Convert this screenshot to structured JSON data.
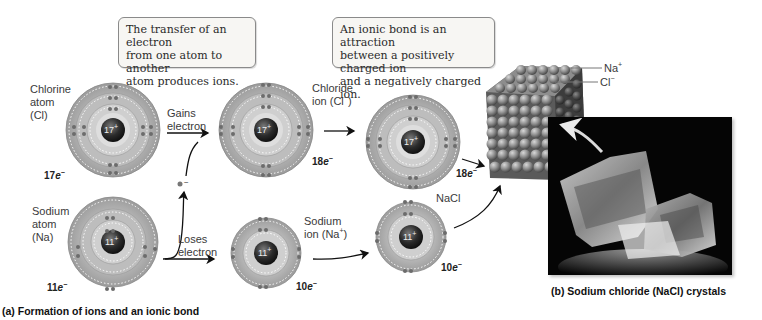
{
  "figure": {
    "part_a": {
      "caption": "(a) Formation of ions and an ionic bond",
      "callout_transfer": "The transfer of an electron from one atom to another atom produces ions.",
      "callout_transfer_lines": [
        "The transfer of an electron",
        "from one atom to another",
        "atom produces ions."
      ],
      "callout_bond_lines": [
        "An ionic bond is an attraction",
        "between a positively charged ion",
        "and a negatively charged ion."
      ],
      "chlorine_atom": {
        "label_lines": [
          "Chlorine",
          "atom",
          "(Cl)"
        ],
        "nucleus": "17",
        "nucleus_charge": "+",
        "electrons_num": "17",
        "electrons_unit": "e",
        "electrons_sup": "−"
      },
      "sodium_atom": {
        "label_lines": [
          "Sodium",
          "atom",
          "(Na)"
        ],
        "nucleus": "11",
        "nucleus_charge": "+",
        "electrons_num": "11",
        "electrons_unit": "e",
        "electrons_sup": "−"
      },
      "gains_electron": [
        "Gains",
        "electron"
      ],
      "loses_electron": [
        "Loses",
        "electron"
      ],
      "chloride_ion": {
        "label_line1": "Chloride",
        "label_line2_prefix": "ion (Cl",
        "label_sup": "−",
        "label_suffix": ")",
        "nucleus": "17",
        "nucleus_charge": "+",
        "electrons_num": "18",
        "electrons_unit": "e",
        "electrons_sup": "−"
      },
      "sodium_ion": {
        "label_line1": "Sodium",
        "label_line2_prefix": "ion (Na",
        "label_sup": "+",
        "label_suffix": ")",
        "nucleus": "11",
        "nucleus_charge": "+",
        "electrons_num": "10",
        "electrons_unit": "e",
        "electrons_sup": "−"
      },
      "nacl": {
        "label": "NaCl",
        "chloride": {
          "nucleus": "17",
          "nucleus_charge": "+",
          "electrons_num": "18",
          "electrons_unit": "e",
          "electrons_sup": "−"
        },
        "sodium": {
          "nucleus": "11",
          "nucleus_charge": "+",
          "electrons_num": "10",
          "electrons_unit": "e",
          "electrons_sup": "−"
        }
      },
      "free_electron_sup": "−"
    },
    "part_b": {
      "caption": "(b) Sodium chloride (NaCl) crystals",
      "lattice_labels": {
        "na": "Na",
        "na_sup": "+",
        "cl": "Cl",
        "cl_sup": "−"
      }
    },
    "colors": {
      "shell_outer": "#a9a9a9",
      "shell_light": "#d9d9d9",
      "nucleus": "#2b2b2b",
      "callout_bg": "#f7f6f3",
      "photo_bg": "#050505"
    }
  }
}
